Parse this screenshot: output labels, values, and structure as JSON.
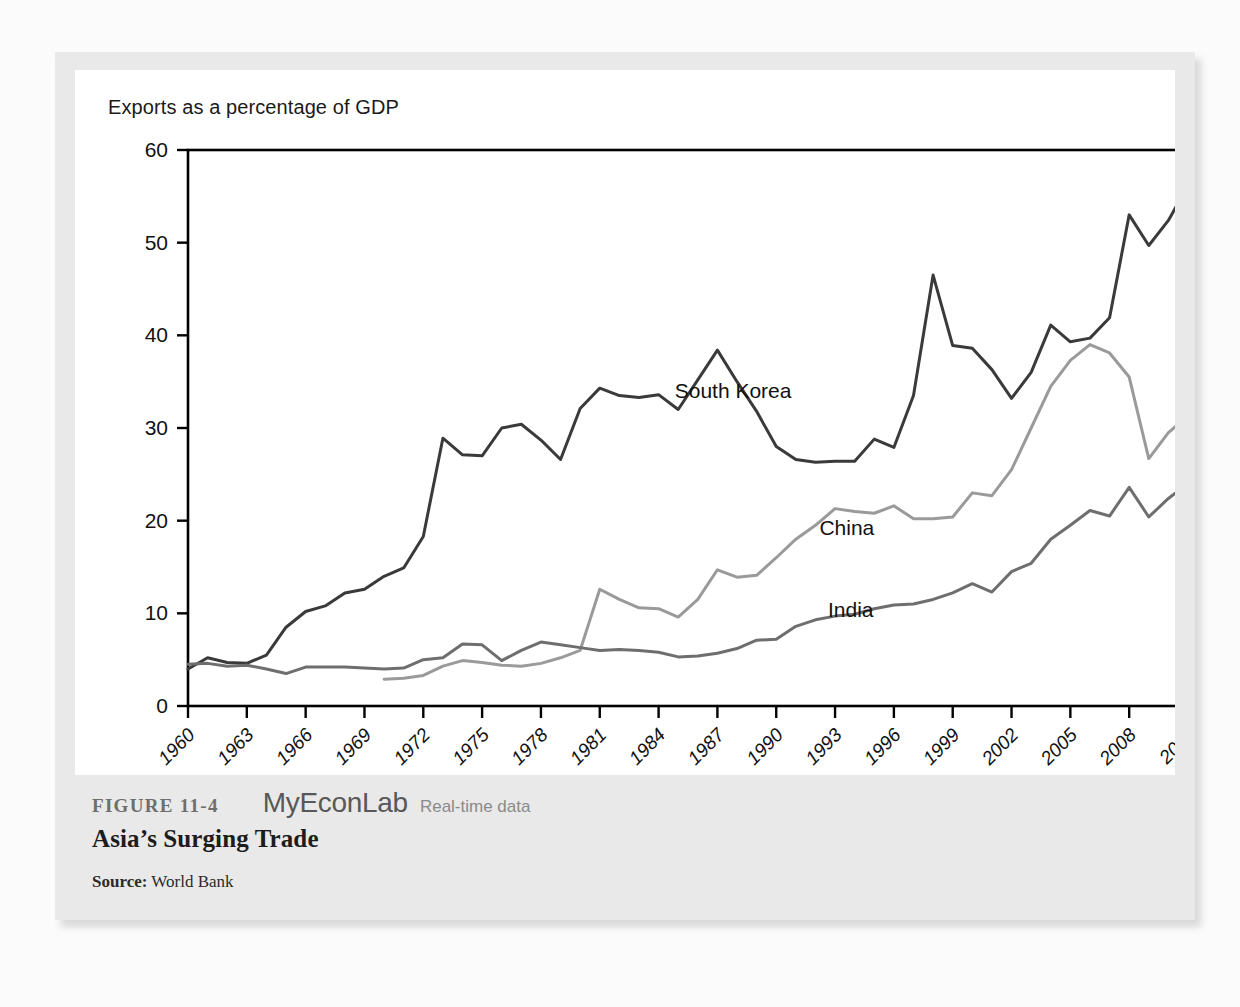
{
  "figure": {
    "number": "FIGURE 11-4",
    "brand": "MyEconLab",
    "brand_tagline": "Real-time data",
    "title": "Asia’s Surging Trade",
    "source_label": "Source:",
    "source_value": "World Bank"
  },
  "chart_data": {
    "type": "line",
    "title": "Exports as a percentage of GDP",
    "xlabel": "",
    "ylabel": "Exports as a percentage of GDP",
    "xlim": [
      1960,
      2011
    ],
    "ylim": [
      0,
      60
    ],
    "y_ticks": [
      0,
      10,
      20,
      30,
      40,
      50,
      60
    ],
    "x_ticks": [
      1960,
      1963,
      1966,
      1969,
      1972,
      1975,
      1978,
      1981,
      1984,
      1987,
      1990,
      1993,
      1996,
      1999,
      2002,
      2005,
      2008,
      2011
    ],
    "grid": false,
    "legend_position": "inline-labels",
    "colors": {
      "south_korea": "#3a3a3a",
      "china": "#9a9a9a",
      "india": "#6e6e6e",
      "axis": "#000000"
    },
    "series": [
      {
        "name": "South Korea",
        "color": "#3a3a3a",
        "x": [
          1960,
          1961,
          1962,
          1963,
          1964,
          1965,
          1966,
          1967,
          1968,
          1969,
          1970,
          1971,
          1972,
          1973,
          1974,
          1975,
          1976,
          1977,
          1978,
          1979,
          1980,
          1981,
          1982,
          1983,
          1984,
          1985,
          1986,
          1987,
          1988,
          1989,
          1990,
          1991,
          1992,
          1993,
          1994,
          1995,
          1996,
          1997,
          1998,
          1999,
          2000,
          2001,
          2002,
          2003,
          2004,
          2005,
          2006,
          2007,
          2008,
          2009,
          2010,
          2011
        ],
        "values": [
          4.0,
          5.2,
          4.7,
          4.6,
          5.5,
          8.5,
          10.2,
          10.8,
          12.2,
          12.6,
          14.0,
          14.9,
          18.3,
          28.9,
          27.1,
          27.0,
          30.0,
          30.4,
          28.7,
          26.6,
          32.1,
          34.3,
          33.5,
          33.3,
          33.6,
          32.0,
          35.2,
          38.4,
          35.0,
          31.8,
          28.0,
          26.6,
          26.3,
          26.4,
          26.4,
          28.8,
          27.9,
          33.5,
          46.5,
          38.9,
          38.6,
          36.3,
          33.2,
          36.0,
          41.1,
          39.3,
          39.7,
          41.9,
          53.0,
          49.7,
          52.4,
          56.2
        ]
      },
      {
        "name": "China",
        "color": "#9a9a9a",
        "x": [
          1970,
          1971,
          1972,
          1973,
          1974,
          1975,
          1976,
          1977,
          1978,
          1979,
          1980,
          1981,
          1982,
          1983,
          1984,
          1985,
          1986,
          1987,
          1988,
          1989,
          1990,
          1991,
          1992,
          1993,
          1994,
          1995,
          1996,
          1997,
          1998,
          1999,
          2000,
          2001,
          2002,
          2003,
          2004,
          2005,
          2006,
          2007,
          2008,
          2009,
          2010,
          2011
        ],
        "values": [
          2.9,
          3.0,
          3.3,
          4.3,
          4.9,
          4.7,
          4.4,
          4.3,
          4.6,
          5.2,
          6.0,
          12.6,
          11.5,
          10.6,
          10.5,
          9.6,
          11.5,
          14.7,
          13.9,
          14.1,
          16.0,
          18.0,
          19.5,
          21.3,
          21.0,
          20.8,
          21.6,
          20.2,
          20.2,
          20.4,
          23.0,
          22.7,
          25.5,
          30.0,
          34.5,
          37.3,
          39.0,
          38.1,
          35.5,
          26.7,
          29.5,
          31.3
        ]
      },
      {
        "name": "India",
        "color": "#6e6e6e",
        "x": [
          1960,
          1961,
          1962,
          1963,
          1964,
          1965,
          1966,
          1967,
          1968,
          1969,
          1970,
          1971,
          1972,
          1973,
          1974,
          1975,
          1976,
          1977,
          1978,
          1979,
          1980,
          1981,
          1982,
          1983,
          1984,
          1985,
          1986,
          1987,
          1988,
          1989,
          1990,
          1991,
          1992,
          1993,
          1994,
          1995,
          1996,
          1997,
          1998,
          1999,
          2000,
          2001,
          2002,
          2003,
          2004,
          2005,
          2006,
          2007,
          2008,
          2009,
          2010,
          2011
        ],
        "values": [
          4.5,
          4.6,
          4.3,
          4.4,
          4.0,
          3.5,
          4.2,
          4.2,
          4.2,
          4.1,
          4.0,
          4.1,
          5.0,
          5.2,
          6.7,
          6.6,
          4.9,
          6.0,
          6.9,
          6.6,
          6.3,
          6.0,
          6.1,
          6.0,
          5.8,
          5.3,
          5.4,
          5.7,
          6.2,
          7.1,
          7.2,
          8.6,
          9.3,
          9.7,
          9.9,
          10.5,
          10.9,
          11.0,
          11.5,
          12.2,
          13.2,
          12.3,
          14.5,
          15.4,
          18.0,
          19.5,
          21.1,
          20.5,
          23.6,
          20.4,
          22.4,
          24.0
        ]
      }
    ],
    "annotations": [
      {
        "label": "South Korea",
        "x": 1987.8,
        "y": 33.2
      },
      {
        "label": "China",
        "x": 1993.6,
        "y": 18.5
      },
      {
        "label": "India",
        "x": 1993.8,
        "y": 9.6
      }
    ]
  }
}
